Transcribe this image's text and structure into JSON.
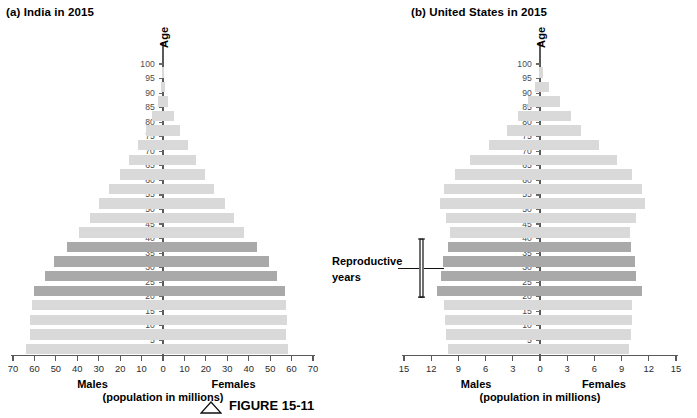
{
  "figure": {
    "caption_label": "FIGURE 15-11",
    "caption_icon": "triangle-marker"
  },
  "panels": [
    {
      "id": "india",
      "title": "(a) India in 2015",
      "y_axis_title": "Age",
      "x_axis_label_left": "Males",
      "x_axis_label_right": "Females",
      "x_axis_units": "(population in millions)",
      "x_ticks": [
        70,
        60,
        50,
        40,
        30,
        20,
        10,
        0,
        10,
        20,
        30,
        40,
        50,
        60,
        70
      ],
      "x_max": 70,
      "y_ticks": [
        5,
        10,
        15,
        20,
        25,
        30,
        35,
        40,
        45,
        50,
        55,
        60,
        65,
        70,
        75,
        80,
        85,
        90,
        95,
        100
      ]
    },
    {
      "id": "us",
      "title": "(b) United States in 2015",
      "y_axis_title": "Age",
      "x_axis_label_left": "Males",
      "x_axis_label_right": "Females",
      "x_axis_units": "(population in millions)",
      "x_ticks": [
        15,
        12,
        9,
        6,
        3,
        0,
        3,
        6,
        9,
        12,
        15
      ],
      "x_max": 15,
      "y_ticks": [
        5,
        10,
        15,
        20,
        25,
        30,
        35,
        40,
        45,
        50,
        55,
        60,
        65,
        70,
        75,
        80,
        85,
        90,
        95,
        100
      ]
    }
  ],
  "annotation": {
    "repro_line1": "Reproductive",
    "repro_line2": "years",
    "repro_age_range": [
      20,
      39
    ]
  },
  "legend_colors": {
    "bar_light": "#d9d9d9",
    "bar_dark": "#a9a9a9",
    "axis": "#5a5a5a"
  },
  "chart_data": [
    {
      "type": "bar",
      "subtype": "population-pyramid",
      "title": "(a) India in 2015",
      "xlabel": "(population in millions)",
      "ylabel": "Age",
      "xlim": [
        -70,
        70
      ],
      "ylim": [
        0,
        100
      ],
      "grid": false,
      "legend": "none",
      "age_groups": [
        "0-4",
        "5-9",
        "10-14",
        "15-19",
        "20-24",
        "25-29",
        "30-34",
        "35-39",
        "40-44",
        "45-49",
        "50-54",
        "55-59",
        "60-64",
        "65-69",
        "70-74",
        "75-79",
        "80-84",
        "85-89",
        "90-94",
        "95-99"
      ],
      "highlight_groups": [
        "20-24",
        "25-29",
        "30-34",
        "35-39"
      ],
      "series": [
        {
          "name": "Males",
          "side": "left",
          "values": [
            64.0,
            62.0,
            62.0,
            61.0,
            60.0,
            55.0,
            51.0,
            45.0,
            39.0,
            34.0,
            30.0,
            25.0,
            20.0,
            16.0,
            11.5,
            8.0,
            5.0,
            2.5,
            1.0,
            0.3
          ]
        },
        {
          "name": "Females",
          "side": "right",
          "values": [
            58.5,
            57.5,
            58.0,
            57.5,
            57.0,
            53.0,
            49.5,
            44.0,
            38.0,
            33.0,
            29.0,
            24.0,
            19.5,
            15.5,
            11.5,
            8.0,
            5.0,
            2.5,
            1.0,
            0.3
          ]
        }
      ]
    },
    {
      "type": "bar",
      "subtype": "population-pyramid",
      "title": "(b) United States in 2015",
      "xlabel": "(population in millions)",
      "ylabel": "Age",
      "xlim": [
        -15,
        15
      ],
      "ylim": [
        0,
        100
      ],
      "grid": false,
      "legend": "none",
      "age_groups": [
        "0-4",
        "5-9",
        "10-14",
        "15-19",
        "20-24",
        "25-29",
        "30-34",
        "35-39",
        "40-44",
        "45-49",
        "50-54",
        "55-59",
        "60-64",
        "65-69",
        "70-74",
        "75-79",
        "80-84",
        "85-89",
        "90-94",
        "95-99"
      ],
      "highlight_groups": [
        "20-24",
        "25-29",
        "30-34",
        "35-39"
      ],
      "series": [
        {
          "name": "Males",
          "side": "left",
          "values": [
            10.2,
            10.4,
            10.5,
            10.6,
            11.4,
            10.9,
            10.7,
            10.1,
            9.9,
            10.4,
            11.0,
            10.6,
            9.4,
            7.7,
            5.6,
            3.6,
            2.4,
            1.3,
            0.5,
            0.1
          ]
        },
        {
          "name": "Females",
          "side": "right",
          "values": [
            9.8,
            10.0,
            10.1,
            10.2,
            11.3,
            10.6,
            10.5,
            10.0,
            9.9,
            10.6,
            11.6,
            11.2,
            10.1,
            8.5,
            6.5,
            4.5,
            3.4,
            2.2,
            1.0,
            0.3
          ]
        }
      ]
    }
  ]
}
